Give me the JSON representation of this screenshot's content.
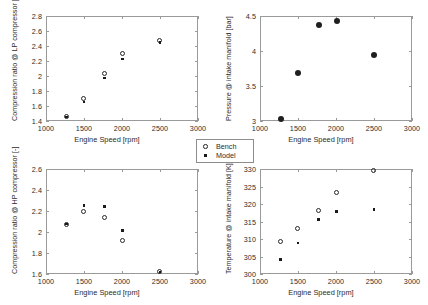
{
  "figure": {
    "background": "#ffffff",
    "axis_color": "#9a9a9a",
    "marker_color": "#1f1f1f"
  },
  "legend": {
    "entries": [
      {
        "label": "Bench",
        "marker": "open-circle-icon"
      },
      {
        "label": "Model",
        "marker": "filled-dot-icon"
      }
    ]
  },
  "chart_data": [
    {
      "id": "lp-compression-ratio",
      "type": "scatter",
      "title": "",
      "position": "top-left",
      "xlabel": "Engine Speed [rpm]",
      "ylabel": "Compression ratio @ LP compressor [-]",
      "xlim": [
        1000,
        3000
      ],
      "ylim": [
        1.4,
        2.8
      ],
      "xticks": [
        1000,
        1500,
        2000,
        2500,
        3000
      ],
      "yticks": [
        1.4,
        1.6,
        1.8,
        2.0,
        2.2,
        2.4,
        2.6,
        2.8
      ],
      "yticklabels": [
        "1.4",
        "1.6",
        "1.8",
        "2",
        "2.2",
        "2.4",
        "2.6",
        "2.8"
      ],
      "xticklabels": [
        "1000",
        "1500",
        "2000",
        "2500",
        "3000"
      ],
      "grid": false,
      "x": [
        1270,
        1500,
        1770,
        2010,
        2500
      ],
      "series": [
        {
          "name": "Bench",
          "marker": "open-circle",
          "values": [
            1.455,
            1.69,
            2.03,
            2.3,
            2.47
          ]
        },
        {
          "name": "Model",
          "marker": "dot",
          "values": [
            1.452,
            1.655,
            1.975,
            2.225,
            2.445
          ]
        }
      ]
    },
    {
      "id": "intake-manifold-pressure",
      "type": "scatter",
      "title": "",
      "position": "top-right",
      "xlabel": "Engine Speed [rpm]",
      "ylabel": "Pressure @ intake manifold [bar]",
      "xlim": [
        1000,
        3000
      ],
      "ylim": [
        3,
        4.5
      ],
      "xticks": [
        1000,
        1500,
        2000,
        2500,
        3000
      ],
      "yticks": [
        3,
        3.5,
        4,
        4.5
      ],
      "yticklabels": [
        "3",
        "3.5",
        "4",
        "4.5"
      ],
      "xticklabels": [
        "1000",
        "1500",
        "2000",
        "2500",
        "3000"
      ],
      "grid": false,
      "x": [
        1270,
        1500,
        1770,
        2010,
        2500
      ],
      "series": [
        {
          "name": "Bench",
          "marker": "open-circle",
          "values": [
            3.03,
            3.68,
            4.37,
            4.43,
            3.94
          ]
        },
        {
          "name": "Model",
          "marker": "dot",
          "values": [
            3.03,
            3.68,
            4.37,
            4.43,
            3.94
          ]
        }
      ]
    },
    {
      "id": "hp-compression-ratio",
      "type": "scatter",
      "title": "",
      "position": "bottom-left",
      "xlabel": "Engine Speed [rpm]",
      "ylabel": "Compression ratio @ HP compressor [-]",
      "xlim": [
        1000,
        3000
      ],
      "ylim": [
        1.6,
        2.6
      ],
      "xticks": [
        1000,
        1500,
        2000,
        2500,
        3000
      ],
      "yticks": [
        1.6,
        1.8,
        2.0,
        2.2,
        2.4,
        2.6
      ],
      "yticklabels": [
        "1.6",
        "1.8",
        "2",
        "2.2",
        "2.4",
        "2.6"
      ],
      "xticklabels": [
        "1000",
        "1500",
        "2000",
        "2500",
        "3000"
      ],
      "grid": false,
      "x": [
        1270,
        1500,
        1770,
        2010,
        2500
      ],
      "series": [
        {
          "name": "Bench",
          "marker": "open-circle",
          "values": [
            2.07,
            2.19,
            2.135,
            1.91,
            1.615
          ]
        },
        {
          "name": "Model",
          "marker": "dot",
          "values": [
            2.075,
            2.255,
            2.245,
            2.015,
            1.62
          ]
        }
      ]
    },
    {
      "id": "intake-manifold-temperature",
      "type": "scatter",
      "title": "",
      "position": "bottom-right",
      "xlabel": "Engine Speed [rpm]",
      "ylabel": "Temperature @ intake manifold [K]",
      "xlim": [
        1000,
        3000
      ],
      "ylim": [
        300,
        330
      ],
      "xticks": [
        1000,
        1500,
        2000,
        2500,
        3000
      ],
      "yticks": [
        300,
        305,
        310,
        315,
        320,
        325,
        330
      ],
      "yticklabels": [
        "300",
        "305",
        "310",
        "315",
        "320",
        "325",
        "330"
      ],
      "xticklabels": [
        "1000",
        "1500",
        "2000",
        "2500",
        "3000"
      ],
      "grid": false,
      "x": [
        1270,
        1500,
        1770,
        2010,
        2500
      ],
      "series": [
        {
          "name": "Bench",
          "marker": "open-circle",
          "values": [
            309.2,
            313.0,
            318.0,
            323.1,
            329.4
          ]
        },
        {
          "name": "Model",
          "marker": "dot",
          "values": [
            304.2,
            308.9,
            315.5,
            317.9,
            318.4
          ]
        }
      ]
    }
  ]
}
